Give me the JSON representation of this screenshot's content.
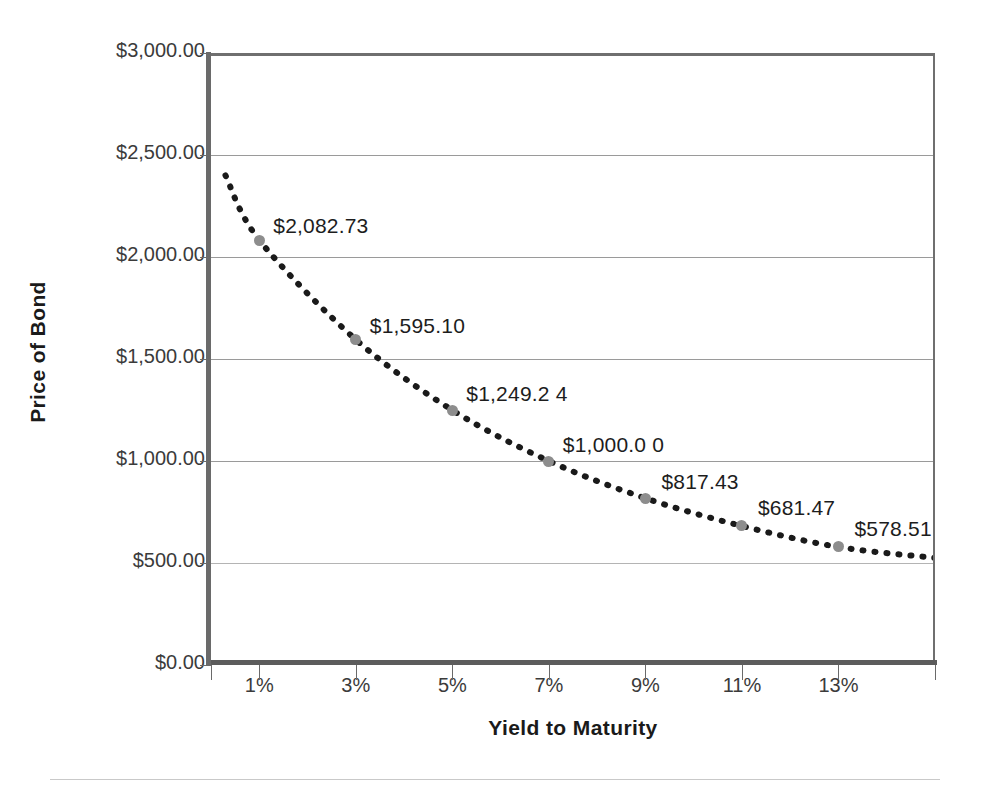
{
  "chart_data": {
    "type": "line",
    "title": "",
    "xlabel": "Yield to Maturity",
    "ylabel": "Price of Bond",
    "x": [
      "1%",
      "3%",
      "5%",
      "7%",
      "9%",
      "11%",
      "13%"
    ],
    "x_numeric": [
      1,
      3,
      5,
      7,
      9,
      11,
      13
    ],
    "values": [
      2082.73,
      1595.1,
      1249.24,
      1000.0,
      817.43,
      681.47,
      578.51
    ],
    "point_labels": [
      "$2,082.73",
      "$1,595.10",
      "$1,249.2 4",
      "$1,000.0 0",
      "$817.43",
      "$681.47",
      "$578.51"
    ],
    "ylim": [
      0,
      3000
    ],
    "ytick_values": [
      0,
      500,
      1000,
      1500,
      2000,
      2500,
      3000
    ],
    "ytick_labels": [
      "$0.00",
      "$500.00",
      "$1,000.00",
      "$1,500.00",
      "$2,000.00",
      "$2,500.00",
      "$3,000.00"
    ],
    "xtick_labels": [
      "1%",
      "3%",
      "5%",
      "7%",
      "9%",
      "11%",
      "13%"
    ],
    "grid": "horizontal",
    "legend": "none",
    "line_style": "dotted",
    "marker": "circle",
    "colors": {
      "line": "#1a1a1a",
      "marker": "#8d8d8d",
      "grid": "#9a9a9a",
      "axis": "#6a6a6a",
      "text": "#3b3b3b",
      "title_text": "#1a1a1a",
      "background": "#ffffff",
      "bottom_rule": "#c9c9c9"
    }
  },
  "axes": {
    "y_title": "Price of Bond",
    "x_title": "Yield to Maturity"
  }
}
